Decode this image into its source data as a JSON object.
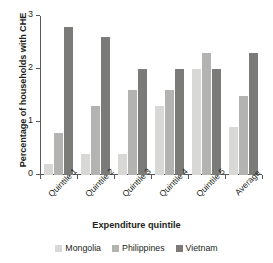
{
  "chart_data": {
    "type": "bar",
    "title": "",
    "xlabel": "Expenditure quintile",
    "ylabel": "Percentage of households with CHE",
    "categories": [
      "Quintile 1",
      "Quintile 2",
      "Quintile 3",
      "Quintile 4",
      "Quintile 5",
      "Average"
    ],
    "series": [
      {
        "name": "Mongolia",
        "color": "#d8d8d6",
        "values": [
          0.2,
          0.4,
          0.4,
          1.3,
          2.0,
          0.9
        ]
      },
      {
        "name": "Philippines",
        "color": "#b3b3b1",
        "values": [
          0.8,
          1.3,
          1.6,
          1.6,
          2.3,
          1.5
        ]
      },
      {
        "name": "Vietnam",
        "color": "#7b7b79",
        "values": [
          2.8,
          2.6,
          2.0,
          2.0,
          2.0,
          2.3
        ]
      }
    ],
    "ylim": [
      0,
      3
    ],
    "yticks": [
      0,
      1,
      2,
      3
    ],
    "ytick_labels": [
      "0",
      "1",
      "2",
      "3"
    ],
    "grid": false,
    "legend_position": "bottom"
  }
}
